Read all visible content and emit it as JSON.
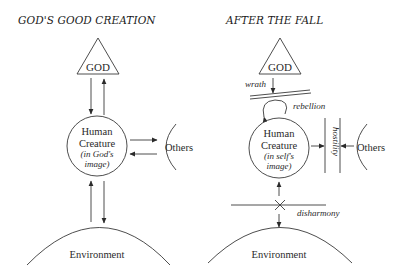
{
  "left": {
    "title": "GOD'S GOOD CREATION",
    "god": "GOD",
    "human_line1": "Human",
    "human_line2": "Creature",
    "human_line3": "(in God's",
    "human_line4": "image)",
    "others": "Others",
    "environment": "Environment"
  },
  "right": {
    "title": "AFTER THE FALL",
    "god": "GOD",
    "wrath": "wrath",
    "rebellion": "rebellion",
    "human_line1": "Human",
    "human_line2": "Creature",
    "human_line3": "(in self's",
    "human_line4": "image)",
    "hostility": "hostility",
    "others": "Others",
    "disharmony": "disharmony",
    "environment": "Environment"
  },
  "colors": {
    "line": "#3a3a3a",
    "text": "#2a2a2a",
    "background": "#ffffff"
  }
}
